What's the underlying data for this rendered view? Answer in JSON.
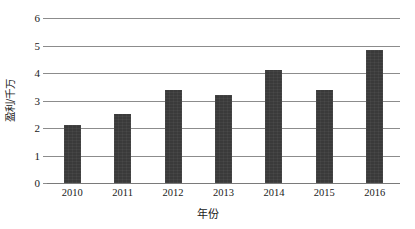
{
  "chart_data": {
    "type": "bar",
    "title": "",
    "subtitle": "",
    "xlabel": "年份",
    "ylabel": "盈利/千万",
    "categories": [
      "2010",
      "2011",
      "2012",
      "2013",
      "2014",
      "2015",
      "2016"
    ],
    "values": [
      2.1,
      2.5,
      3.4,
      3.2,
      4.1,
      3.4,
      4.85
    ],
    "series": [
      {
        "name": "盈利",
        "values": [
          2.1,
          2.5,
          3.4,
          3.2,
          4.1,
          3.4,
          4.85
        ]
      }
    ],
    "ylim": [
      0,
      6
    ],
    "ytick_step": 1,
    "ytick_labels": [
      "0",
      "1",
      "2",
      "3",
      "4",
      "5",
      "6"
    ],
    "grid": "horizontal",
    "legend": "none",
    "bar_color": "#3a3a3a",
    "gridline_color": "#8c8c8c",
    "background_color": "#ffffff",
    "annotations": []
  }
}
